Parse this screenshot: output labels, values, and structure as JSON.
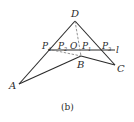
{
  "figure": {
    "caption": "(b)",
    "line_color": "#2a2a2a",
    "dash_color": "#777777",
    "points": {
      "A": {
        "label": "A"
      },
      "B": {
        "label": "B"
      },
      "C": {
        "label": "C"
      },
      "D": {
        "label": "D"
      },
      "O": {
        "label": "O"
      },
      "P1": {
        "label": "P",
        "sub": "1"
      },
      "P2": {
        "label": "P",
        "sub": "2"
      },
      "P3": {
        "label": "P",
        "sub": "3"
      },
      "P4": {
        "label": "P",
        "sub": "4"
      }
    },
    "line_label": "l"
  }
}
